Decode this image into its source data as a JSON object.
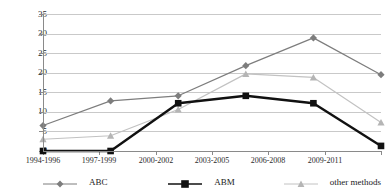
{
  "chart_data": {
    "type": "line",
    "title": "",
    "xlabel": "",
    "ylabel": "",
    "ylim": [
      0,
      35
    ],
    "ytick_step": 5,
    "yticks": [
      "0",
      "5",
      "10",
      "15",
      "20",
      "25",
      "30",
      "35"
    ],
    "grid": true,
    "legend_position": "bottom",
    "categories": [
      "1994-1996",
      "1997-1999",
      "2000-2002",
      "2003-2005",
      "2006-2008",
      "2009-2011"
    ],
    "series": [
      {
        "name": "ABC",
        "marker": "diamond",
        "color": "#7d7d7d",
        "values": [
          6.5,
          12.8,
          14.1,
          21.8,
          28.9,
          19.5
        ]
      },
      {
        "name": "ABM",
        "marker": "square",
        "color": "#111111",
        "values": [
          0,
          0,
          12.2,
          14.1,
          12.2,
          1.3
        ]
      },
      {
        "name": "other methods",
        "marker": "triangle",
        "color": "#c2c2c2",
        "values": [
          3.0,
          3.9,
          10.6,
          19.7,
          18.8,
          7.3
        ]
      }
    ]
  },
  "axis": {
    "y_labels": [
      "35",
      "30",
      "25",
      "20",
      "15",
      "10",
      "5",
      "0"
    ],
    "x_labels": [
      "1994-1996",
      "1997-1999",
      "2000-2002",
      "2003-2005",
      "2006-2008",
      "2009-2011"
    ]
  },
  "legend": {
    "items": [
      {
        "label": "ABC"
      },
      {
        "label": "ABM"
      },
      {
        "label": "other methods"
      }
    ]
  },
  "colors": {
    "abc": "#7d7d7d",
    "abm": "#111111",
    "other": "#c2c2c2",
    "grid": "#c9c9c9",
    "axis": "#8a8a8a"
  }
}
